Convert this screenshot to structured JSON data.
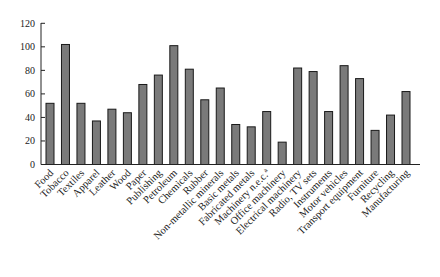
{
  "chart_data": {
    "type": "bar",
    "title": "",
    "xlabel": "",
    "ylabel": "",
    "ylim": [
      0,
      120
    ],
    "yticks": [
      0,
      20,
      40,
      60,
      80,
      100,
      120
    ],
    "grid": false,
    "legend": null,
    "bar_color": "#7a7a7a",
    "bar_edge_color": "#1a1a1a",
    "categories": [
      "Food",
      "Tobacco",
      "Textiles",
      "Apparel",
      "Leather",
      "Wood",
      "Paper",
      "Publishing",
      "Petroleum",
      "Chemicals",
      "Rubber",
      "Non-metallic minerals",
      "Basic metals",
      "Fabricated metals",
      "Machinery n.e.c.",
      "Office machinery",
      "Electrical machinery",
      "Radio, TV sets",
      "Instruments",
      "Motor vehicles",
      "Transport equipment",
      "Furniture",
      "Recycling",
      "Manufacturing"
    ],
    "category_superscripts": {
      "Machinery n.e.c.": "a"
    },
    "values": [
      52,
      102,
      52,
      37,
      47,
      44,
      68,
      76,
      101,
      81,
      55,
      65,
      34,
      32,
      45,
      19,
      82,
      79,
      45,
      84,
      73,
      29,
      42,
      62
    ]
  }
}
